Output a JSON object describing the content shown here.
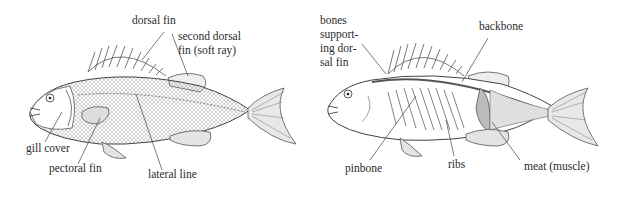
{
  "diagrams": [
    {
      "title": "external anatomy",
      "labels": {
        "dorsal_fin": "dorsal fin",
        "second_dorsal_fin_line1": "second dorsal",
        "second_dorsal_fin_line2": "fin (soft ray)",
        "gill_cover": "gill cover",
        "pectoral_fin": "pectoral fin",
        "lateral_line": "lateral line"
      }
    },
    {
      "title": "internal anatomy",
      "labels": {
        "bones_line1": "bones",
        "bones_line2": "support-",
        "bones_line3": "ing dor-",
        "bones_line4": "sal fin",
        "backbone": "backbone",
        "pinbone": "pinbone",
        "ribs": "ribs",
        "meat": "meat (muscle)"
      }
    }
  ],
  "colors": {
    "ink": "#2b2b2b",
    "line": "#555555",
    "background": "#ffffff"
  }
}
